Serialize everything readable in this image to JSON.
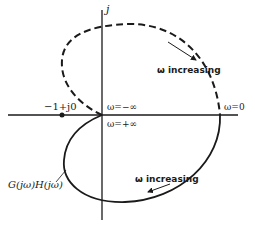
{
  "diagram": {
    "type": "nyquist-plot",
    "axes": {
      "imag_label": "j"
    },
    "points": {
      "critical_point": "−1+j0",
      "omega_zero": "ω=0",
      "omega_neg_inf": "ω=−∞",
      "omega_pos_inf": "ω=+∞"
    },
    "annotations": {
      "upper_direction": "ω increasing",
      "lower_direction": "ω increasing",
      "curve_label": "G(jω)H(jω)"
    },
    "colors": {
      "ink": "#1a1a1a",
      "background": "#ffffff"
    }
  }
}
